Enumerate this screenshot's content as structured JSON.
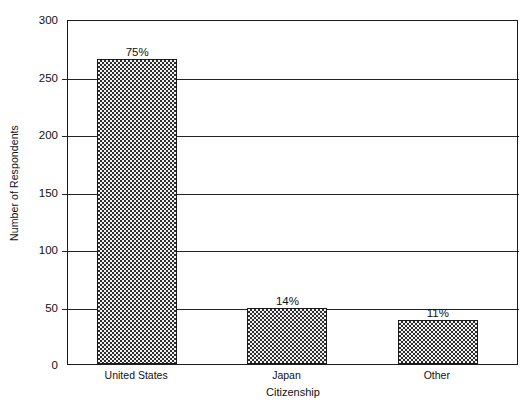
{
  "chart_data": {
    "type": "bar",
    "title": "",
    "xlabel": "Citizenship",
    "ylabel": "Number of Respondents",
    "categories": [
      "United States",
      "Japan",
      "Other"
    ],
    "values": [
      265,
      49,
      38
    ],
    "data_labels": [
      "75%",
      "14%",
      "11%"
    ],
    "ylim": [
      0,
      300
    ],
    "yticks": [
      0,
      50,
      100,
      150,
      200,
      250,
      300
    ],
    "ytick_labels": [
      "0",
      "50",
      "100",
      "150",
      "200",
      "250",
      "300"
    ],
    "grid": "horizontal",
    "legend": "none",
    "series": [
      {
        "name": "Number of Respondents",
        "values": [
          265,
          49,
          38
        ],
        "fill": "checkerboard-hatch",
        "color": "#8a8a8a",
        "edge_color": "#1b1b1b"
      }
    ],
    "colors": {
      "background": "#ffffff",
      "axis": "#1b1b1b",
      "gridline": "#232323",
      "text": "#111111",
      "bar_fill": "#8a8a8a"
    }
  }
}
